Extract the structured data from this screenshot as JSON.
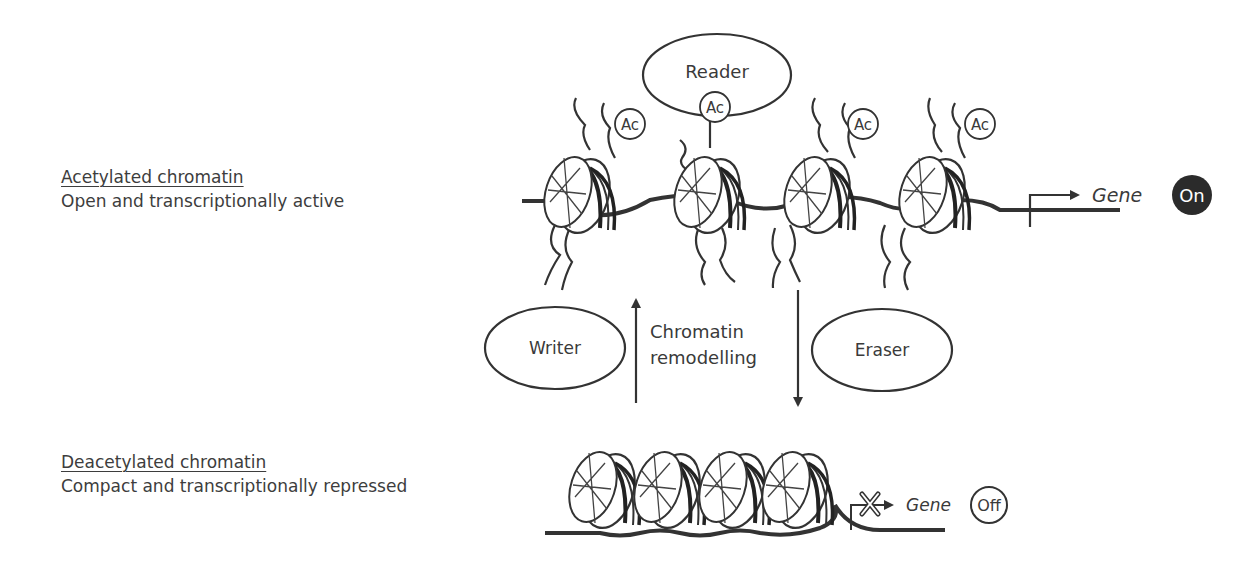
{
  "states": {
    "acetylated": {
      "title": "Acetylated chromatin",
      "description": "Open and transcriptionally active",
      "gene_label": "Gene",
      "gene_status": "On",
      "mark_label": "Ac"
    },
    "deacetylated": {
      "title": "Deacetylated chromatin",
      "description": "Compact and transcriptionally repressed",
      "gene_label": "Gene",
      "gene_status": "Off"
    }
  },
  "proteins": {
    "reader": "Reader",
    "writer": "Writer",
    "eraser": "Eraser"
  },
  "process": {
    "line1": "Chromatin",
    "line2": "remodelling"
  },
  "colors": {
    "ink": "#333333",
    "background": "#ffffff",
    "on_badge": "#2b2b2b"
  }
}
